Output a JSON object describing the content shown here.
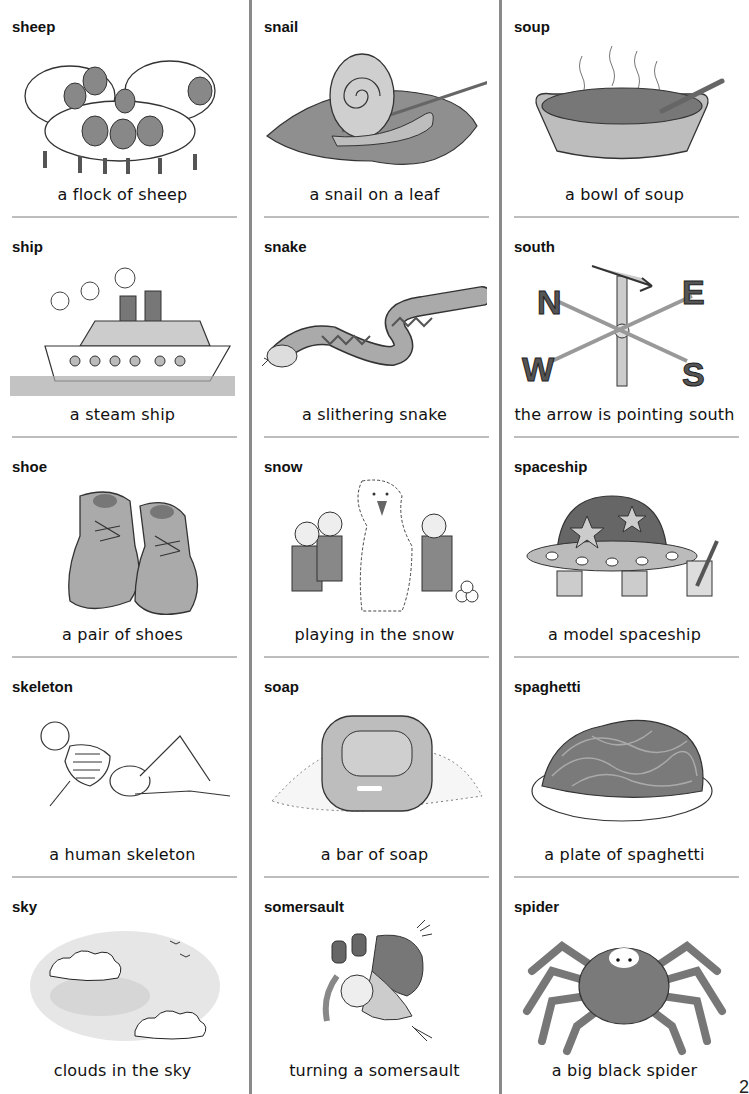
{
  "page": {
    "page_number": "2",
    "cells": [
      {
        "word": "sheep",
        "caption": "a flock of sheep",
        "icon": "sheep-flock-icon"
      },
      {
        "word": "snail",
        "caption": "a snail on a leaf",
        "icon": "snail-icon"
      },
      {
        "word": "soup",
        "caption": "a bowl of soup",
        "icon": "soup-bowl-icon"
      },
      {
        "word": "ship",
        "caption": "a steam ship",
        "icon": "steam-ship-icon"
      },
      {
        "word": "snake",
        "caption": "a slithering snake",
        "icon": "snake-icon"
      },
      {
        "word": "south",
        "caption": "the arrow is pointing south",
        "icon": "weather-vane-icon",
        "compass_letters": [
          "N",
          "E",
          "W",
          "S"
        ]
      },
      {
        "word": "shoe",
        "caption": "a pair of shoes",
        "icon": "shoes-icon"
      },
      {
        "word": "snow",
        "caption": "playing in the snow",
        "icon": "snowman-kids-icon"
      },
      {
        "word": "spaceship",
        "caption": "a model spaceship",
        "icon": "spaceship-model-icon"
      },
      {
        "word": "skeleton",
        "caption": "a human skeleton",
        "icon": "skeleton-icon"
      },
      {
        "word": "soap",
        "caption": "a bar of soap",
        "icon": "soap-bar-icon"
      },
      {
        "word": "spaghetti",
        "caption": "a plate of spaghetti",
        "icon": "spaghetti-plate-icon"
      },
      {
        "word": "sky",
        "caption": "clouds in the sky",
        "icon": "clouds-sky-icon"
      },
      {
        "word": "somersault",
        "caption": "turning a somersault",
        "icon": "somersault-child-icon"
      },
      {
        "word": "spider",
        "caption": "a big black spider",
        "icon": "spider-icon"
      }
    ]
  }
}
